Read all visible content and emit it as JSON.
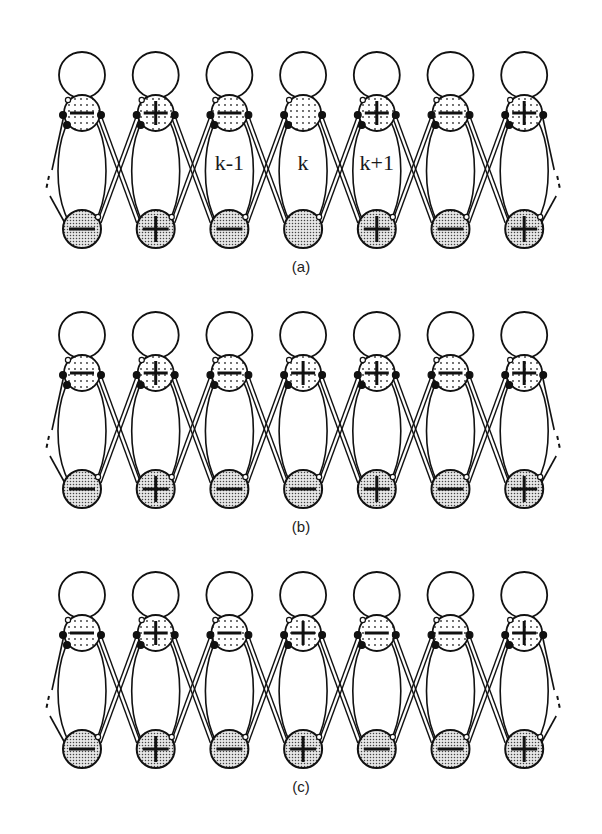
{
  "figure": {
    "cell_spacing": 73.7,
    "first_cell_x": 82,
    "colors": {
      "stroke": "#111111",
      "dot_fill": "#f4f4f4",
      "dense_fill": "#c8c8c8",
      "background": "#ffffff"
    },
    "panels": [
      {
        "id": "a",
        "caption": "(a)",
        "offset_y": 0,
        "top_signs": [
          "-",
          "+",
          "-",
          "",
          "+",
          "-",
          "+"
        ],
        "bottom_signs": [
          "-",
          "+",
          "-",
          "",
          "+",
          "-",
          "+"
        ],
        "cell_labels": [
          "",
          "",
          "k-1",
          "k",
          "k+1",
          "",
          ""
        ]
      },
      {
        "id": "b",
        "caption": "(b)",
        "offset_y": 260,
        "top_signs": [
          "-",
          "+",
          "-",
          "+",
          "+",
          "-",
          "+"
        ],
        "bottom_signs": [
          "-",
          "+",
          "-",
          "-",
          "+",
          "-",
          "+"
        ],
        "cell_labels": [
          "",
          "",
          "",
          "",
          "",
          "",
          ""
        ]
      },
      {
        "id": "c",
        "caption": "(c)",
        "offset_y": 520,
        "top_signs": [
          "-",
          "+",
          "-",
          "+",
          "-",
          "-",
          "+"
        ],
        "bottom_signs": [
          "-",
          "+",
          "-",
          "+",
          "-",
          "-",
          "+"
        ],
        "cell_labels": [
          "",
          "",
          "",
          "",
          "",
          "",
          ""
        ]
      }
    ]
  }
}
